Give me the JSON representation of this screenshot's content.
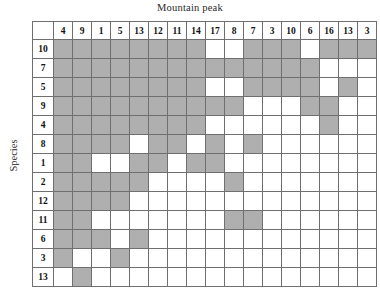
{
  "chart_data": {
    "type": "heatmap",
    "title": "Mountain peak",
    "xlabel": "Mountain peak",
    "ylabel": "Species",
    "grid": true,
    "legend": "none",
    "corner_label": "",
    "colors": {
      "filled": "#9a9a9a",
      "empty": "#ffffff",
      "gridline": "#6f6f6f"
    },
    "value_meaning": {
      "1": "present (shaded)",
      "0": "absent (white)"
    },
    "columns": [
      "4",
      "9",
      "1",
      "5",
      "13",
      "12",
      "11",
      "14",
      "17",
      "8",
      "7",
      "3",
      "10",
      "6",
      "16",
      "13",
      "3"
    ],
    "rows": [
      "10",
      "7",
      "5",
      "9",
      "4",
      "8",
      "1",
      "2",
      "12",
      "11",
      "6",
      "3",
      "13"
    ],
    "matrix": [
      [
        1,
        1,
        1,
        1,
        1,
        1,
        1,
        1,
        0,
        0,
        1,
        1,
        1,
        0,
        1,
        1,
        1
      ],
      [
        1,
        1,
        1,
        1,
        1,
        1,
        1,
        1,
        1,
        1,
        1,
        1,
        1,
        1,
        0,
        0,
        0
      ],
      [
        1,
        1,
        1,
        1,
        1,
        1,
        1,
        1,
        0,
        0,
        1,
        1,
        1,
        1,
        0,
        1,
        0
      ],
      [
        1,
        1,
        1,
        1,
        1,
        1,
        1,
        1,
        1,
        1,
        0,
        0,
        0,
        1,
        1,
        0,
        0
      ],
      [
        1,
        1,
        1,
        1,
        1,
        1,
        1,
        1,
        0,
        0,
        0,
        0,
        0,
        0,
        1,
        0,
        0
      ],
      [
        1,
        1,
        1,
        1,
        0,
        1,
        1,
        0,
        1,
        0,
        1,
        0,
        0,
        0,
        0,
        0,
        0
      ],
      [
        1,
        1,
        0,
        0,
        1,
        1,
        0,
        1,
        1,
        0,
        0,
        0,
        0,
        0,
        0,
        0,
        0
      ],
      [
        1,
        1,
        1,
        1,
        1,
        0,
        0,
        0,
        0,
        1,
        0,
        0,
        0,
        0,
        0,
        0,
        0
      ],
      [
        1,
        1,
        1,
        1,
        0,
        0,
        0,
        0,
        0,
        0,
        0,
        0,
        0,
        0,
        0,
        0,
        0
      ],
      [
        1,
        1,
        0,
        0,
        0,
        0,
        0,
        0,
        0,
        1,
        1,
        0,
        0,
        0,
        0,
        0,
        0
      ],
      [
        1,
        1,
        1,
        0,
        1,
        0,
        0,
        0,
        0,
        0,
        0,
        0,
        0,
        0,
        0,
        0,
        0
      ],
      [
        1,
        0,
        0,
        1,
        0,
        0,
        0,
        0,
        0,
        0,
        0,
        0,
        0,
        0,
        0,
        0,
        0
      ],
      [
        0,
        1,
        0,
        0,
        0,
        0,
        0,
        0,
        0,
        0,
        0,
        0,
        0,
        0,
        0,
        0,
        0
      ]
    ]
  }
}
